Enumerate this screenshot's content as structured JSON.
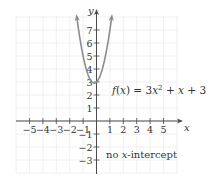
{
  "chart_data": {
    "type": "line",
    "title": "",
    "xlabel": "x",
    "ylabel": "y",
    "xlim": [
      -5.5,
      6.2
    ],
    "ylim": [
      -3.8,
      8.3
    ],
    "grid": true,
    "x_ticks": [
      -5,
      -4,
      -3,
      -2,
      -1,
      1,
      2,
      3,
      4,
      5
    ],
    "x_tick_labels": [
      "−5",
      "−4",
      "−3",
      "−2",
      "−1",
      "1",
      "2",
      "3",
      "4",
      "5"
    ],
    "y_ticks": [
      -3,
      -2,
      -1,
      1,
      2,
      3,
      4,
      5,
      6,
      7
    ],
    "y_tick_labels": [
      "−3",
      "−2",
      "−1",
      "1",
      "2",
      "3",
      "4",
      "5",
      "6",
      "7"
    ],
    "series": [
      {
        "name": "f(x) = 3x^2 + x + 3",
        "function": "3x^2 + x + 3",
        "coefficients": {
          "a": 3,
          "b": 1,
          "c": 3
        },
        "x_range": [
          -1.468,
          1.135
        ],
        "vertex": [
          -0.1667,
          2.917
        ],
        "y_intercept": 3,
        "color": "#8c8c8c",
        "arrows_at_ends": true
      }
    ],
    "annotations": [
      {
        "text": "f(x) = 3x² + x + 3",
        "position": [
          1.15,
          2.1
        ]
      },
      {
        "text": "no x-intercept",
        "position": [
          0.7,
          -2.8
        ]
      }
    ]
  },
  "labels": {
    "axis_x": "x",
    "axis_y": "y",
    "func_f": "f",
    "func_open": "(",
    "func_x": "x",
    "func_close": ")",
    "func_eq": " = 3",
    "func_x2": "x",
    "func_exp": "2",
    "func_rest_plus": " + ",
    "func_x3": "x",
    "func_tail": " + 3",
    "note_pre": "no ",
    "note_x": "x",
    "note_post": "-intercept"
  },
  "colors": {
    "curve": "#8c8c8c",
    "axes": "#4a4a4a",
    "grid": "#ececec",
    "text": "#333333"
  }
}
